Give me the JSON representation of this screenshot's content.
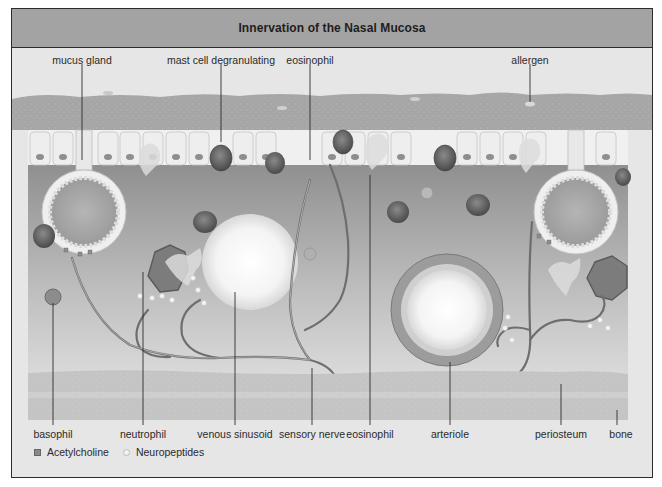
{
  "figure": {
    "title": "Innervation of the Nasal Mucosa"
  },
  "labels": {
    "top": [
      {
        "text": "mucus gland",
        "x": 82,
        "y": 55
      },
      {
        "text": "mast cell degranulating",
        "x": 221,
        "y": 55
      },
      {
        "text": "eosinophil",
        "x": 310,
        "y": 55
      },
      {
        "text": "allergen",
        "x": 530,
        "y": 55
      }
    ],
    "bottom": [
      {
        "text": "basophil",
        "x": 53,
        "y": 430
      },
      {
        "text": "neutrophil",
        "x": 143,
        "y": 430
      },
      {
        "text": "venous sinusoid",
        "x": 235,
        "y": 430
      },
      {
        "text": "sensory nerve",
        "x": 312,
        "y": 430
      },
      {
        "text": "eosinophil",
        "x": 370,
        "y": 430
      },
      {
        "text": "arteriole",
        "x": 450,
        "y": 430
      },
      {
        "text": "periosteum",
        "x": 561,
        "y": 430
      },
      {
        "text": "bone",
        "x": 621,
        "y": 430
      }
    ]
  },
  "legend": {
    "items": [
      {
        "symbol": "square",
        "label": "Acetylcholine"
      },
      {
        "symbol": "circle",
        "label": "Neuropeptides"
      }
    ]
  },
  "colors": {
    "header_bg": "#a3a3a3",
    "frame_bg": "#e6e6e6",
    "mucus_layer": "#a8a8a8",
    "epithelium": "#ececec",
    "lamina_propria": "#8f8f8f",
    "bone": "#bdbdbd"
  }
}
